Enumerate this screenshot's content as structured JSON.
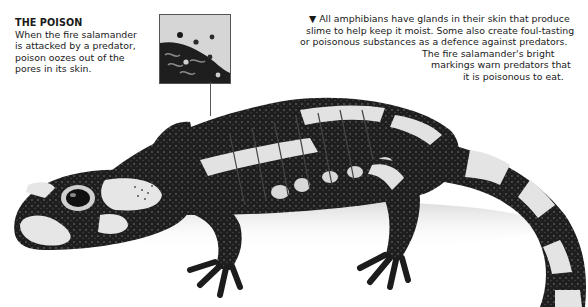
{
  "left_caption": {
    "title": "THE POISON",
    "lines": [
      "When the fire salamander",
      "is attacked by a predator,",
      "poison oozes out of the",
      "pores in its skin."
    ]
  },
  "right_caption": {
    "bullet_icon": "▼",
    "lines": [
      "All amphibians have glands in their skin that produce",
      "slime to help keep it moist. Some also create foul-tasting",
      "or poisonous substances as a defence against predators.",
      "The fire salamander's bright",
      "markings warn predators that",
      "it is poisonous to eat."
    ]
  },
  "illustration": {
    "subject": "fire salamander",
    "callout": "skin-closeup"
  },
  "colors": {
    "text": "#1a1a1a",
    "background": "#ffffff",
    "salamander_dark": "#1c1c1c",
    "salamander_light": "#e6e6e6"
  }
}
